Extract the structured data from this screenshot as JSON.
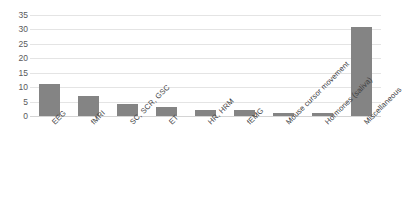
{
  "chart_data": {
    "type": "bar",
    "title": "",
    "xlabel": "",
    "ylabel": "",
    "ylim": [
      0,
      35
    ],
    "ytick_step": 5,
    "yticks": [
      35,
      30,
      25,
      20,
      15,
      10,
      5,
      0
    ],
    "grid": true,
    "legend": false,
    "bar_color": "#848484",
    "gridline_color": "#e4e4e4",
    "categories": [
      "EEG",
      "fMRI",
      "SC, SCR, GSC",
      "ET",
      "HR, HRM",
      "fEMG",
      "Mouse cursor movement",
      "Hormones (saliva)",
      "Miscellaneous"
    ],
    "values": [
      11,
      7,
      4,
      3,
      2,
      2,
      1,
      1,
      31
    ]
  }
}
